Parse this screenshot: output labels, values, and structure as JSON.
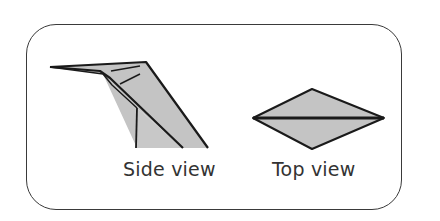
{
  "diagram": {
    "labels": {
      "side_view": "Side view",
      "top_view": "Top view"
    },
    "colors": {
      "fill": "#c4c4c4",
      "stroke": "#1a1a1a",
      "border": "#3a3a3a",
      "background": "#ffffff"
    }
  }
}
